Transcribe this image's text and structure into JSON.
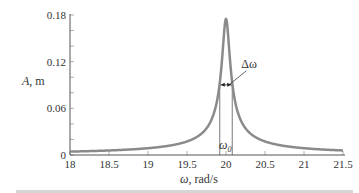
{
  "chart_data": {
    "type": "line",
    "title": "",
    "xlabel": "ω, rad/s",
    "ylabel": "A, m",
    "xlim": [
      18,
      21.5
    ],
    "ylim": [
      0,
      0.18
    ],
    "x_ticks": [
      "18",
      "18.5",
      "19",
      "19.5",
      "20",
      "20.5",
      "21",
      "21.5"
    ],
    "y_ticks": [
      "0",
      "0.06",
      "0.12",
      "0.18"
    ],
    "grid": false,
    "legend": null,
    "series": [
      {
        "name": "Resonance curve A(ω)",
        "color": "#8a8a8a",
        "x": [
          18.0,
          18.5,
          19.0,
          19.3,
          19.5,
          19.7,
          19.8,
          19.85,
          19.9,
          19.92,
          19.95,
          19.97,
          20.0,
          20.03,
          20.05,
          20.08,
          20.1,
          20.15,
          20.2,
          20.3,
          20.5,
          21.0,
          21.5
        ],
        "values": [
          0.004,
          0.006,
          0.009,
          0.012,
          0.017,
          0.029,
          0.042,
          0.053,
          0.078,
          0.093,
          0.124,
          0.15,
          0.175,
          0.15,
          0.124,
          0.093,
          0.078,
          0.055,
          0.042,
          0.029,
          0.017,
          0.009,
          0.006
        ]
      }
    ],
    "annotations": [
      {
        "text": "Δω",
        "description": "bandwidth arrow between half-power points",
        "x_left": 19.92,
        "x_right": 20.08,
        "y": 0.08
      },
      {
        "text": "ω0",
        "description": "resonant frequency, vertical lines at 19.92 and 20.08 bracket it",
        "x": 20.0
      }
    ]
  },
  "labels": {
    "ylabel_main": "A",
    "ylabel_unit": ", m",
    "xlabel_main": "ω",
    "xlabel_unit": ", rad/s",
    "delta_omega": "Δω",
    "omega0_main": "ω",
    "omega0_sub": "0"
  }
}
